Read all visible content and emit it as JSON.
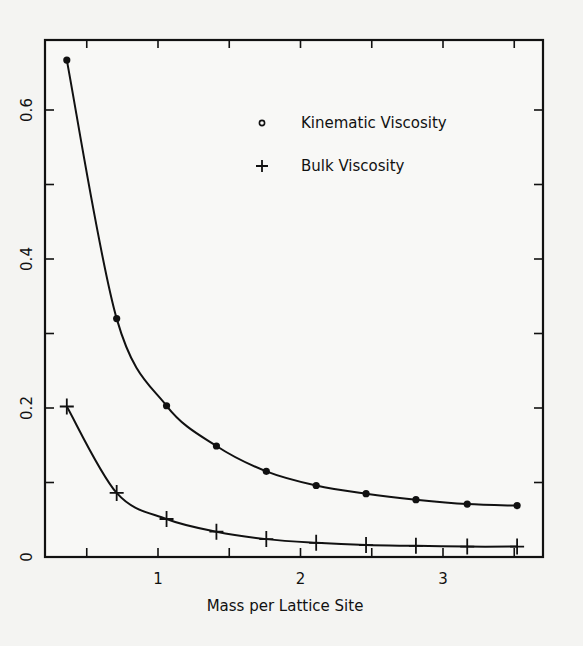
{
  "chart_data": {
    "type": "line",
    "title": "",
    "xlabel": "Mass per Lattice Site",
    "ylabel": "",
    "xlim": [
      0.21,
      3.7
    ],
    "ylim": [
      0,
      0.69
    ],
    "x_ticks": [
      0.5,
      1,
      1.5,
      2,
      2.5,
      3,
      3.5
    ],
    "x_tick_labels": [
      "",
      "1",
      "",
      "2",
      "",
      "3",
      ""
    ],
    "y_ticks": [
      0,
      0.1,
      0.2,
      0.3,
      0.4,
      0.5,
      0.6
    ],
    "y_tick_labels": [
      "0",
      "",
      "0.2",
      "",
      "0.4",
      "",
      "0.6"
    ],
    "grid": false,
    "legend_position": "upper right (inside)",
    "x": [
      0.36,
      0.71,
      1.06,
      1.41,
      1.76,
      2.11,
      2.46,
      2.81,
      3.17,
      3.52
    ],
    "series": [
      {
        "name": "Kinematic Viscosity",
        "marker": "circle",
        "values": [
          0.667,
          0.32,
          0.203,
          0.149,
          0.115,
          0.096,
          0.085,
          0.077,
          0.071,
          0.069
        ]
      },
      {
        "name": "Bulk Viscosity",
        "marker": "plus",
        "values": [
          0.202,
          0.086,
          0.051,
          0.034,
          0.024,
          0.019,
          0.016,
          0.015,
          0.014,
          0.014
        ]
      }
    ]
  },
  "legend": {
    "items": [
      {
        "label": "Kinematic Viscosity",
        "marker": "circle"
      },
      {
        "label": "Bulk Viscosity",
        "marker": "plus"
      }
    ]
  },
  "axes": {
    "xlabel": "Mass per Lattice Site",
    "x_tick_labels": [
      "1",
      "2",
      "3"
    ],
    "y_tick_labels": [
      "0",
      "0.2",
      "0.4",
      "0.6"
    ]
  },
  "colors": {
    "ink": "#111111",
    "paper": "#f4f4f2"
  }
}
